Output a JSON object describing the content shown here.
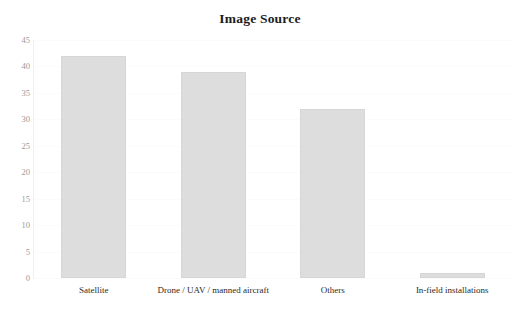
{
  "chart_data": {
    "type": "bar",
    "title": "Image Source",
    "xlabel": "",
    "ylabel": "",
    "categories": [
      "Satellite",
      "Drone / UAV / manned aircraft",
      "Others",
      "In-field installations"
    ],
    "values": [
      42,
      39,
      32,
      1
    ],
    "ylim": [
      0,
      45
    ],
    "ytick_labels": [
      "0",
      "5",
      "10",
      "15",
      "20",
      "25",
      "30",
      "35",
      "40",
      "45"
    ],
    "ytick_values": [
      0,
      5,
      10,
      15,
      20,
      25,
      30,
      35,
      40,
      45
    ],
    "grid": true,
    "legend": "none",
    "bar_color": "#dddddd",
    "bar_border_color": "#d6d6d6",
    "gridline_color": "#fbfbfb",
    "axis_color": "#f0f0f0",
    "title_color": "#1c1c1c",
    "tick_label_color": "#9a9a9a",
    "category_label_color": "#2a2a2a",
    "background_color": "#ffffff"
  }
}
